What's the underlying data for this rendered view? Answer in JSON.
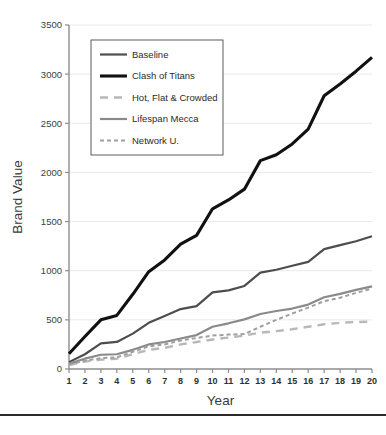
{
  "chart_data": {
    "type": "line",
    "title": "",
    "xlabel": "Year",
    "ylabel": "Brand Value",
    "x": [
      1,
      2,
      3,
      4,
      5,
      6,
      7,
      8,
      9,
      10,
      11,
      12,
      13,
      14,
      15,
      16,
      17,
      18,
      19,
      20
    ],
    "xlim": [
      1,
      20
    ],
    "ylim": [
      0,
      3500
    ],
    "yticks": [
      0,
      500,
      1000,
      1500,
      2000,
      2500,
      3000,
      3500
    ],
    "xticks": [
      1,
      2,
      3,
      4,
      5,
      6,
      7,
      8,
      9,
      10,
      11,
      12,
      13,
      14,
      15,
      16,
      17,
      18,
      19,
      20
    ],
    "grid": "horizontal",
    "legend_position": "upper-left-inside",
    "series": [
      {
        "name": "Baseline",
        "color": "#4d4d4d",
        "width": 2.2,
        "dash": "none",
        "values": [
          70,
          150,
          260,
          275,
          360,
          470,
          540,
          610,
          640,
          780,
          800,
          845,
          980,
          1010,
          1050,
          1090,
          1220,
          1260,
          1300,
          1350
        ]
      },
      {
        "name": "Clash of Titans",
        "color": "#111111",
        "width": 3.1,
        "dash": "none",
        "values": [
          155,
          330,
          500,
          545,
          760,
          990,
          1110,
          1270,
          1360,
          1630,
          1720,
          1830,
          2120,
          2180,
          2290,
          2440,
          2780,
          2900,
          3030,
          3170
        ]
      },
      {
        "name": "Hot, Flat & Crowded",
        "color": "#b8b8b8",
        "width": 2.4,
        "dash": "long",
        "values": [
          40,
          75,
          95,
          105,
          150,
          195,
          215,
          250,
          275,
          300,
          320,
          340,
          370,
          385,
          405,
          430,
          455,
          470,
          478,
          482
        ]
      },
      {
        "name": "Lifespan Mecca",
        "color": "#8a8a8a",
        "width": 2.2,
        "dash": "none",
        "values": [
          55,
          105,
          145,
          150,
          195,
          250,
          275,
          310,
          345,
          430,
          465,
          505,
          560,
          590,
          615,
          655,
          730,
          765,
          805,
          840
        ]
      },
      {
        "name": "Network U.",
        "color": "#9e9e9e",
        "width": 2.0,
        "dash": "short",
        "values": [
          45,
          85,
          110,
          118,
          175,
          230,
          250,
          290,
          315,
          340,
          350,
          355,
          430,
          500,
          565,
          625,
          690,
          725,
          775,
          818
        ]
      }
    ]
  },
  "legend": {
    "items": [
      {
        "label": "Baseline"
      },
      {
        "label": "Clash of Titans"
      },
      {
        "label": "Hot, Flat & Crowded"
      },
      {
        "label": "Lifespan Mecca"
      },
      {
        "label": "Network U."
      }
    ]
  },
  "footer": {
    "ghost_text": ""
  }
}
